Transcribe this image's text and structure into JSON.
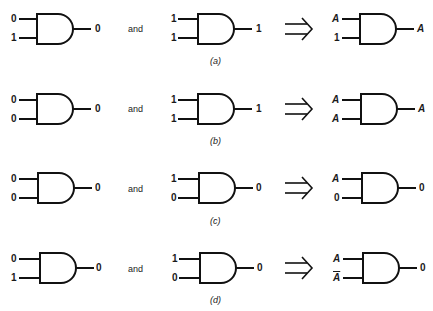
{
  "rows": [
    {
      "caption": "(a)",
      "conjunction": "and",
      "implies_symbol": "⇒",
      "gate1": {
        "in1": "0",
        "in2": "1",
        "out": "0"
      },
      "gate2": {
        "in1": "1",
        "in2": "1",
        "out": "1"
      },
      "result": {
        "in1": "A",
        "in2": "1",
        "out": "A"
      }
    },
    {
      "caption": "(b)",
      "conjunction": "and",
      "implies_symbol": "⇒",
      "gate1": {
        "in1": "0",
        "in2": "0",
        "out": "0"
      },
      "gate2": {
        "in1": "1",
        "in2": "1",
        "out": "1"
      },
      "result": {
        "in1": "A",
        "in2": "A",
        "out": "A"
      }
    },
    {
      "caption": "(c)",
      "conjunction": "and",
      "implies_symbol": "⇒",
      "gate1": {
        "in1": "0",
        "in2": "0",
        "out": "0"
      },
      "gate2": {
        "in1": "1",
        "in2": "0",
        "out": "0"
      },
      "result": {
        "in1": "A",
        "in2": "0",
        "out": "0"
      }
    },
    {
      "caption": "(d)",
      "conjunction": "and",
      "implies_symbol": "⇒",
      "gate1": {
        "in1": "0",
        "in2": "1",
        "out": "0"
      },
      "gate2": {
        "in1": "1",
        "in2": "0",
        "out": "0"
      },
      "result": {
        "in1": "A",
        "in2": "A",
        "in2_overbar": true,
        "out": "0"
      }
    }
  ]
}
